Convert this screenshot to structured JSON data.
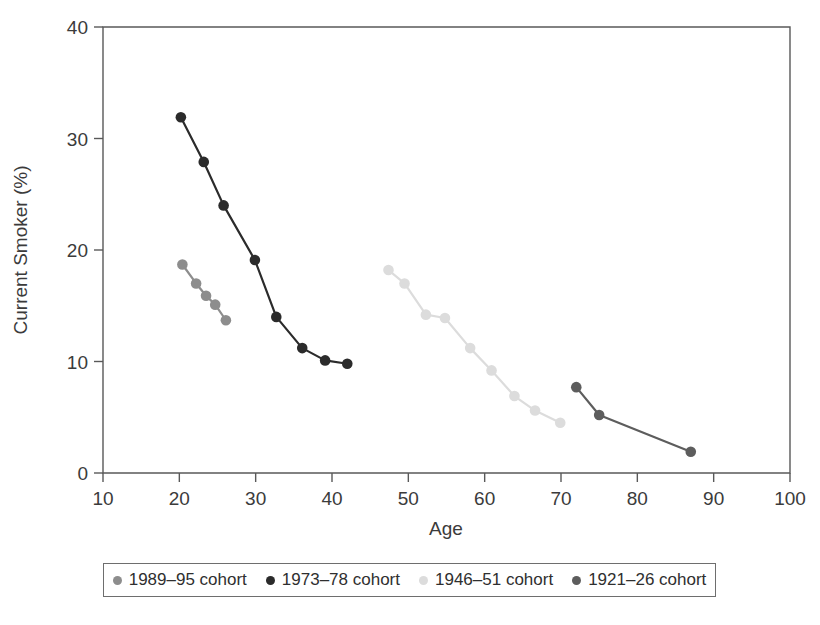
{
  "chart_data": {
    "type": "line",
    "title": "",
    "xlabel": "Age",
    "ylabel": "Current Smoker (%)",
    "xlim": [
      10,
      100
    ],
    "ylim": [
      0,
      40
    ],
    "xticks": [
      10,
      20,
      30,
      40,
      50,
      60,
      70,
      80,
      90,
      100
    ],
    "yticks": [
      0,
      10,
      20,
      30,
      40
    ],
    "grid": false,
    "legend_position": "bottom",
    "series": [
      {
        "name": "1989–95 cohort",
        "color": "#8d8d8d",
        "x": [
          20.4,
          22.2,
          23.5,
          24.7,
          26.1
        ],
        "y": [
          18.7,
          17.0,
          15.9,
          15.1,
          13.7
        ]
      },
      {
        "name": "1973–78 cohort",
        "color": "#2b2b2b",
        "x": [
          20.2,
          23.2,
          25.8,
          29.9,
          32.7,
          36.1,
          39.1,
          42.0
        ],
        "y": [
          31.9,
          27.9,
          24.0,
          19.1,
          14.0,
          11.2,
          10.1,
          9.8
        ]
      },
      {
        "name": "1946–51 cohort",
        "color": "#dcdcdc",
        "x": [
          47.4,
          49.5,
          52.3,
          54.8,
          58.1,
          60.9,
          63.9,
          66.6,
          69.9
        ],
        "y": [
          18.2,
          17.0,
          14.2,
          13.9,
          11.2,
          9.2,
          6.9,
          5.6,
          4.5
        ]
      },
      {
        "name": "1921–26 cohort",
        "color": "#5d5d5d",
        "x": [
          72.0,
          75.0,
          87.0
        ],
        "y": [
          7.7,
          5.2,
          1.9
        ]
      }
    ]
  },
  "legend": {
    "items": [
      {
        "label": "1989–95 cohort",
        "color": "#8d8d8d"
      },
      {
        "label": "1973–78 cohort",
        "color": "#2b2b2b"
      },
      {
        "label": "1946–51 cohort",
        "color": "#dcdcdc"
      },
      {
        "label": "1921–26 cohort",
        "color": "#5d5d5d"
      }
    ]
  }
}
